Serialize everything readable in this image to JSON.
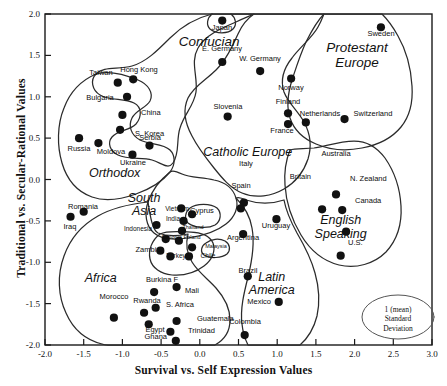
{
  "chart_data": {
    "type": "scatter",
    "title": "",
    "xlabel": "Survival vs. Self Expression Values",
    "ylabel": "Traditional vs. Secular-Rational Values",
    "xlim": [
      -2.0,
      3.0
    ],
    "ylim": [
      -2.0,
      2.0
    ],
    "xticks": [
      "-2.0",
      "-1.5",
      "-1.0",
      "-0.5",
      "0.0",
      "0.5",
      "1.0",
      "1.5",
      "2.0",
      "2.5",
      "3.0"
    ],
    "yticks": [
      "-2.0",
      "-1.5",
      "-1.0",
      "-0.5",
      "0.0",
      "0.5",
      "1.0",
      "1.5",
      "2.0"
    ],
    "grid": false,
    "legend": {
      "position": "bottom-right",
      "shape": "ellipse",
      "lines": [
        "1 (mean)",
        "Standard",
        "Deviation"
      ]
    },
    "cluster_labels": [
      {
        "name": "Confucian",
        "x": 0.12,
        "y": 1.66,
        "size": 13.5
      },
      {
        "name": "Protestant Europe",
        "x": 2.03,
        "y": 1.5,
        "size": 13.5,
        "lines": [
          "Protestant",
          "Europe"
        ]
      },
      {
        "name": "Catholic Europe",
        "x": 0.62,
        "y": 0.32,
        "size": 12.5
      },
      {
        "name": "Orthodox",
        "x": -1.1,
        "y": 0.07,
        "size": 12.5
      },
      {
        "name": "South Asia",
        "x": -0.72,
        "y": -0.31,
        "size": 12.5,
        "lines": [
          "South",
          "Asia"
        ]
      },
      {
        "name": "English Speaking",
        "x": 1.82,
        "y": -0.58,
        "size": 12.5,
        "lines": [
          "English",
          "Speaking"
        ]
      },
      {
        "name": "Latin America",
        "x": 0.93,
        "y": -1.26,
        "size": 12.5,
        "lines": [
          "Latin",
          "America"
        ]
      },
      {
        "name": "Africa",
        "x": -1.28,
        "y": -1.2,
        "size": 12.5
      }
    ],
    "points": [
      {
        "name": "Japan",
        "x": 0.29,
        "y": 1.92,
        "lx": 222,
        "ly": 31,
        "anchor": "middle",
        "fs": 7.5
      },
      {
        "name": "Sweden",
        "x": 2.34,
        "y": 1.84,
        "lx": 381,
        "ly": 37,
        "anchor": "middle",
        "fs": 7.5
      },
      {
        "name": "E. Germany",
        "x": 0.29,
        "y": 1.42,
        "lx": 222,
        "ly": 52,
        "anchor": "middle",
        "fs": 7.5
      },
      {
        "name": "W. Germany",
        "x": 0.78,
        "y": 1.31,
        "lx": 260,
        "ly": 62,
        "anchor": "middle",
        "fs": 7.5
      },
      {
        "name": "Norway",
        "x": 1.18,
        "y": 1.22,
        "lx": 291,
        "ly": 91,
        "anchor": "middle",
        "fs": 7.5
      },
      {
        "name": "Hong Kong",
        "x": -0.86,
        "y": 1.21,
        "lx": 139,
        "ly": 73,
        "anchor": "middle",
        "fs": 7.5
      },
      {
        "name": "Taiwan",
        "x": -1.06,
        "y": 1.17,
        "lx": 101,
        "ly": 76,
        "anchor": "middle",
        "fs": 7.5
      },
      {
        "name": "Bulgaria",
        "x": -0.94,
        "y": 1.0,
        "lx": 100,
        "ly": 101,
        "anchor": "middle",
        "fs": 7.5
      },
      {
        "name": "Slovenia",
        "x": 0.36,
        "y": 0.76,
        "lx": 228,
        "ly": 110,
        "anchor": "middle",
        "fs": 7.5
      },
      {
        "name": "China",
        "x": -1.0,
        "y": 0.78,
        "lx": 141,
        "ly": 116,
        "anchor": "start",
        "fs": 7.5
      },
      {
        "name": "Finland",
        "x": 1.14,
        "y": 0.8,
        "lx": 288,
        "ly": 105,
        "anchor": "middle",
        "fs": 7.5
      },
      {
        "name": "Netherlands",
        "x": 1.37,
        "y": 0.69,
        "lx": 320,
        "ly": 117,
        "anchor": "middle",
        "fs": 7.5
      },
      {
        "name": "Switzerland",
        "x": 1.87,
        "y": 0.73,
        "lx": 373,
        "ly": 117,
        "anchor": "middle",
        "fs": 7.5
      },
      {
        "name": "France",
        "x": 1.14,
        "y": 0.67,
        "lx": 282,
        "ly": 134,
        "anchor": "middle",
        "fs": 7.5
      },
      {
        "name": "S. Korea",
        "x": -1.03,
        "y": 0.6,
        "lx": 135,
        "ly": 137,
        "anchor": "start",
        "fs": 7.5
      },
      {
        "name": "Russia",
        "x": -1.56,
        "y": 0.5,
        "lx": 79,
        "ly": 152,
        "anchor": "middle",
        "fs": 7.5
      },
      {
        "name": "Moldova",
        "x": -1.31,
        "y": 0.44,
        "lx": 111,
        "ly": 155,
        "anchor": "middle",
        "fs": 7.5
      },
      {
        "name": "Serbia",
        "x": -0.65,
        "y": 0.41,
        "lx": 150,
        "ly": 141,
        "anchor": "middle",
        "fs": 7.5
      },
      {
        "name": "Ukraine",
        "x": -0.87,
        "y": 0.3,
        "lx": 133,
        "ly": 166,
        "anchor": "middle",
        "fs": 7.5
      },
      {
        "name": "Australia",
        "x": 1.76,
        "y": -0.18,
        "lx": 336,
        "ly": 157,
        "anchor": "middle",
        "fs": 7.5
      },
      {
        "name": "Britain",
        "x": 1.58,
        "y": -0.36,
        "lx": 311,
        "ly": 180,
        "anchor": "end",
        "fs": 7.5
      },
      {
        "name": "N. Zealand",
        "x": 1.84,
        "y": -0.37,
        "lx": 350,
        "ly": 182,
        "anchor": "start",
        "fs": 7.5
      },
      {
        "name": "Italy",
        "x": 0.57,
        "y": -0.28,
        "lx": 246,
        "ly": 167,
        "anchor": "middle",
        "fs": 7.5
      },
      {
        "name": "Spain",
        "x": 0.53,
        "y": -0.35,
        "lx": 241,
        "ly": 189,
        "anchor": "middle",
        "fs": 7.5
      },
      {
        "name": "Canada",
        "x": 1.89,
        "y": -0.63,
        "lx": 355,
        "ly": 204,
        "anchor": "start",
        "fs": 7.5
      },
      {
        "name": "Romania",
        "x": -1.5,
        "y": -0.39,
        "lx": 83,
        "ly": 210,
        "anchor": "middle",
        "fs": 7.5
      },
      {
        "name": "Iraq",
        "x": -1.67,
        "y": -0.45,
        "lx": 70,
        "ly": 230,
        "anchor": "middle",
        "fs": 7.5
      },
      {
        "name": "Cyprus",
        "x": -0.1,
        "y": -0.42,
        "lx": 202,
        "ly": 214,
        "anchor": "middle",
        "fs": 7.5
      },
      {
        "name": "Vietnam",
        "x": -0.24,
        "y": -0.35,
        "lx": 177,
        "ly": 212,
        "anchor": "middle",
        "fs": 6.5
      },
      {
        "name": "India",
        "x": -0.21,
        "y": -0.5,
        "lx": 173,
        "ly": 222,
        "anchor": "middle",
        "fs": 6.5
      },
      {
        "name": "Uruguay",
        "x": 0.99,
        "y": -0.48,
        "lx": 276,
        "ly": 229,
        "anchor": "middle",
        "fs": 7.5
      },
      {
        "name": "Indonesia",
        "x": -0.56,
        "y": -0.55,
        "lx": 138,
        "ly": 232,
        "anchor": "middle",
        "fs": 6.5
      },
      {
        "name": "Thailand",
        "x": -0.23,
        "y": -0.62,
        "lx": 193,
        "ly": 230,
        "anchor": "middle",
        "fs": 5.5
      },
      {
        "name": "Argentina",
        "x": 0.56,
        "y": -0.66,
        "lx": 243,
        "ly": 241,
        "anchor": "middle",
        "fs": 7.5
      },
      {
        "name": "Ethiopia",
        "x": -0.44,
        "y": -0.72,
        "lx": 172,
        "ly": 240,
        "anchor": "middle",
        "fs": 5.5
      },
      {
        "name": "Poland",
        "x": -0.27,
        "y": -0.74,
        "lx": 192,
        "ly": 240,
        "anchor": "middle",
        "fs": 5.5
      },
      {
        "name": "Malaysia",
        "x": -0.1,
        "y": -0.82,
        "lx": 216,
        "ly": 249,
        "anchor": "middle",
        "fs": 5.5
      },
      {
        "name": "Zambia",
        "x": -0.51,
        "y": -0.86,
        "lx": 148,
        "ly": 253,
        "anchor": "middle",
        "fs": 7.5
      },
      {
        "name": "U.S.",
        "x": 1.82,
        "y": -0.92,
        "lx": 348,
        "ly": 246,
        "anchor": "start",
        "fs": 7.5
      },
      {
        "name": "Turkey",
        "x": -0.38,
        "y": -0.93,
        "lx": 176,
        "ly": 259,
        "anchor": "middle",
        "fs": 6.5
      },
      {
        "name": "Chile",
        "x": -0.14,
        "y": -0.93,
        "lx": 208,
        "ly": 259,
        "anchor": "middle",
        "fs": 6.5
      },
      {
        "name": "Brazil",
        "x": 0.62,
        "y": -1.17,
        "lx": 248,
        "ly": 274,
        "anchor": "middle",
        "fs": 7.5
      },
      {
        "name": "Mali",
        "x": -0.3,
        "y": -1.3,
        "lx": 192,
        "ly": 294,
        "anchor": "middle",
        "fs": 7.5
      },
      {
        "name": "Burkina F",
        "x": -0.59,
        "y": -1.36,
        "lx": 162,
        "ly": 283,
        "anchor": "middle",
        "fs": 7.5
      },
      {
        "name": "S. Africa",
        "x": -0.57,
        "y": -1.55,
        "lx": 180,
        "ly": 308,
        "anchor": "middle",
        "fs": 7.5
      },
      {
        "name": "Rwanda",
        "x": -0.72,
        "y": -1.61,
        "lx": 147,
        "ly": 304,
        "anchor": "middle",
        "fs": 7.5
      },
      {
        "name": "Mexico",
        "x": 1.02,
        "y": -1.48,
        "lx": 271,
        "ly": 305,
        "anchor": "end",
        "fs": 7.5
      },
      {
        "name": "Morocco",
        "x": -1.11,
        "y": -1.67,
        "lx": 114,
        "ly": 300,
        "anchor": "middle",
        "fs": 7.5
      },
      {
        "name": "Guatemala",
        "x": -0.3,
        "y": -1.71,
        "lx": 197,
        "ly": 322,
        "anchor": "start",
        "fs": 7.5
      },
      {
        "name": "Egypt",
        "x": -0.66,
        "y": -1.75,
        "lx": 155,
        "ly": 333,
        "anchor": "middle",
        "fs": 7.5
      },
      {
        "name": "Trinidad",
        "x": -0.38,
        "y": -1.84,
        "lx": 188,
        "ly": 334,
        "anchor": "start",
        "fs": 7.5
      },
      {
        "name": "Colombia",
        "x": 0.58,
        "y": -1.88,
        "lx": 245,
        "ly": 325,
        "anchor": "middle",
        "fs": 7.5
      },
      {
        "name": "Ghana",
        "x": -0.31,
        "y": -1.95,
        "lx": 167,
        "ly": 340,
        "anchor": "end",
        "fs": 7.5
      }
    ]
  },
  "colors": {
    "axis": "#1a1a1a",
    "point": "#111111",
    "zone_outline": "#2b2b2b",
    "background": "#ffffff"
  }
}
